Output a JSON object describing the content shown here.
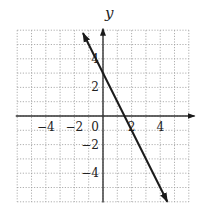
{
  "chart_data": {
    "type": "line",
    "title": "",
    "xlabel": "",
    "ylabel": "y",
    "xlim": [
      -6,
      6
    ],
    "ylim": [
      -6,
      6
    ],
    "grid": true,
    "grid_style": "dotted",
    "x_tick_labels": [
      "-4",
      "-2",
      "0",
      "2",
      "4"
    ],
    "y_tick_labels": [
      "4",
      "2",
      "-2",
      "-4"
    ],
    "series": [
      {
        "name": "y = -2x + 3",
        "equation": "y = -2x + 3",
        "slope": -2,
        "intercept": 3,
        "x": [
          -1.4,
          4.5
        ],
        "y": [
          5.8,
          -6.0
        ],
        "arrows": "both"
      }
    ],
    "colors": {
      "line": "#1a1a1a",
      "axis": "#333333",
      "grid": "#9a9a9a"
    }
  },
  "labels": {
    "y_axis": "y",
    "x_ticks": [
      {
        "text": "−4",
        "value": -4
      },
      {
        "text": "−2",
        "value": -2
      },
      {
        "text": "0",
        "value": 0
      },
      {
        "text": "2",
        "value": 2
      },
      {
        "text": "4",
        "value": 4
      }
    ],
    "y_ticks": [
      {
        "text": "4",
        "value": 4
      },
      {
        "text": "2",
        "value": 2
      },
      {
        "text": "−2",
        "value": -2
      },
      {
        "text": "−4",
        "value": -4
      }
    ]
  }
}
